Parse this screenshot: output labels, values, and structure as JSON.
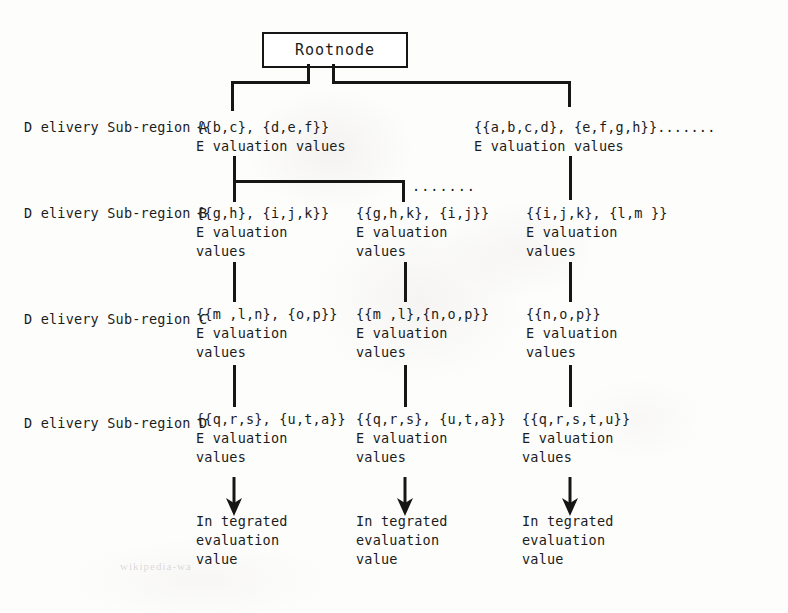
{
  "diagram": {
    "root": {
      "label": "Rootnode"
    },
    "row_labels": [
      {
        "line1": "D elivery",
        "line2": "Sub-region A"
      },
      {
        "line1": "D elivery",
        "line2": "Sub-region B"
      },
      {
        "line1": "D elivery",
        "line2": "Sub-region C"
      },
      {
        "line1": "D elivery",
        "line2": "Sub-region D"
      }
    ],
    "level_a": [
      {
        "set": "{{b,c}, {d,e,f}}",
        "eval_line1": "E valuation values",
        "eval_line2": ""
      },
      {
        "set": "{{a,b,c,d}, {e,f,g,h}}.......",
        "eval_line1": "E valuation values",
        "eval_line2": ""
      }
    ],
    "level_b": [
      {
        "set": "{{g,h}, {i,j,k}}",
        "eval_line1": "E valuation",
        "eval_line2": "values"
      },
      {
        "set": "{{g,h,k}, {i,j}}",
        "eval_line1": "E valuation",
        "eval_line2": "values"
      },
      {
        "set": "{{i,j,k}, {l,m }}",
        "eval_line1": "E valuation",
        "eval_line2": "values"
      }
    ],
    "level_c": [
      {
        "set": "{{m ,l,n}, {o,p}}",
        "eval_line1": "E valuation",
        "eval_line2": "values"
      },
      {
        "set": "{{m ,l},{n,o,p}}",
        "eval_line1": "E valuation",
        "eval_line2": "values"
      },
      {
        "set": "{{n,o,p}}",
        "eval_line1": "E valuation",
        "eval_line2": "values"
      }
    ],
    "level_d": [
      {
        "set": "{{q,r,s}, {u,t,a}}",
        "eval_line1": "E valuation",
        "eval_line2": "values"
      },
      {
        "set": "{{q,r,s}, {u,t,a}}",
        "eval_line1": "E valuation",
        "eval_line2": "values"
      },
      {
        "set": "{{q,r,s,t,u}}",
        "eval_line1": "E valuation",
        "eval_line2": "values"
      }
    ],
    "integrated": [
      {
        "line1": "In tegrated",
        "line2": "evaluation",
        "line3": "value"
      },
      {
        "line1": "In tegrated",
        "line2": "evaluation",
        "line3": "value"
      },
      {
        "line1": "In tegrated",
        "line2": "evaluation",
        "line3": "value"
      }
    ],
    "ellipsis_a": ".......",
    "ellipsis_b": ".......",
    "watermark": "wikipedia-wa",
    "line_color": "#161616"
  }
}
